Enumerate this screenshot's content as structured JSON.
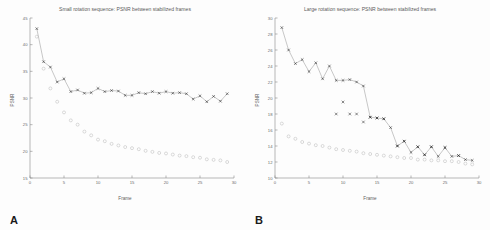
{
  "figure": {
    "background": "#fdfdfd",
    "panel_label_color": "#1a1a1a"
  },
  "panels": [
    {
      "id": "panel-a",
      "label": "A",
      "chart_key": "0"
    },
    {
      "id": "panel-b",
      "label": "B",
      "chart_key": "1"
    }
  ],
  "chart_data": [
    {
      "type": "line",
      "title": "Small rotation sequence: PSNR between stabilized frames",
      "xlabel": "Frame",
      "ylabel": "PSNR",
      "xlim": [
        0,
        30
      ],
      "ylim": [
        15,
        45
      ],
      "xticks": [
        0,
        5,
        10,
        15,
        20,
        25,
        30
      ],
      "yticks": [
        15,
        20,
        25,
        30,
        35,
        40,
        45
      ],
      "grid": false,
      "legend": "none",
      "x": [
        1,
        2,
        3,
        4,
        5,
        6,
        7,
        8,
        9,
        10,
        11,
        12,
        13,
        14,
        15,
        16,
        17,
        18,
        19,
        20,
        21,
        22,
        23,
        24,
        25,
        26,
        27,
        28,
        29
      ],
      "series": [
        {
          "name": "stabilized",
          "marker": "cross",
          "line": true,
          "color": "#2b2b2b",
          "line_color": "#9a9a9a",
          "values": [
            43.0,
            36.8,
            35.8,
            33.0,
            33.6,
            31.2,
            31.5,
            30.9,
            31.0,
            31.8,
            31.2,
            31.4,
            31.3,
            30.5,
            30.5,
            31.0,
            30.8,
            31.2,
            30.9,
            31.2,
            30.9,
            31.0,
            30.8,
            29.8,
            30.4,
            29.3,
            30.3,
            29.4,
            30.8
          ]
        },
        {
          "name": "unstabilized",
          "marker": "circle",
          "line": false,
          "color": "#b6b6b6",
          "values": [
            41.5,
            35.5,
            31.8,
            29.3,
            27.3,
            25.8,
            25.0,
            23.7,
            23.0,
            22.2,
            21.9,
            21.4,
            21.1,
            20.8,
            20.6,
            20.4,
            20.1,
            19.9,
            19.7,
            19.6,
            19.4,
            19.2,
            19.1,
            18.9,
            18.8,
            18.5,
            18.4,
            18.3,
            18.0
          ]
        }
      ]
    },
    {
      "type": "line",
      "title": "Large rotation sequence: PSNR between stabilized frames",
      "xlabel": "Frame",
      "ylabel": "PSNR",
      "xlim": [
        0,
        30
      ],
      "ylim": [
        10,
        30
      ],
      "xticks": [
        0,
        5,
        10,
        15,
        20,
        25,
        30
      ],
      "yticks": [
        10,
        12,
        14,
        16,
        18,
        20,
        22,
        24,
        26,
        28,
        30
      ],
      "grid": false,
      "legend": "none",
      "x": [
        1,
        2,
        3,
        4,
        5,
        6,
        7,
        8,
        9,
        10,
        11,
        12,
        13,
        14,
        15,
        16,
        17,
        18,
        19,
        20,
        21,
        22,
        23,
        24,
        25,
        26,
        27,
        28,
        29
      ],
      "series": [
        {
          "name": "stabilized",
          "marker": "cross",
          "line": true,
          "color": "#2b2b2b",
          "line_color": "#9a9a9a",
          "values": [
            28.8,
            26.0,
            24.3,
            24.8,
            23.3,
            24.4,
            22.4,
            24.0,
            22.2,
            22.2,
            22.3,
            22.0,
            21.5,
            17.6,
            17.5,
            17.4,
            16.3,
            14.0,
            14.6,
            13.2,
            13.9,
            12.9,
            13.9,
            12.7,
            13.8,
            12.7,
            12.8,
            12.3,
            12.2
          ]
        },
        {
          "name": "unstabilized",
          "marker": "circle",
          "line": false,
          "color": "#b6b6b6",
          "values": [
            16.8,
            15.2,
            14.9,
            14.5,
            14.3,
            14.1,
            14.0,
            13.8,
            13.6,
            13.5,
            13.4,
            13.3,
            13.1,
            13.0,
            12.9,
            12.8,
            12.7,
            12.6,
            12.5,
            12.5,
            12.3,
            12.3,
            12.2,
            12.2,
            12.1,
            12.1,
            12.0,
            11.8,
            11.7
          ]
        },
        {
          "name": "scattered-outliers",
          "marker": "cross-only",
          "line": false,
          "color": "#2b2b2b",
          "x": [
            9,
            10,
            11,
            12,
            13,
            14,
            15,
            16,
            18,
            19,
            21,
            22,
            23,
            25,
            27
          ],
          "values": [
            18.0,
            19.5,
            18.0,
            18.0,
            17.0,
            17.6,
            17.5,
            17.4,
            14.0,
            14.6,
            13.9,
            12.9,
            13.9,
            13.8,
            12.8
          ]
        }
      ]
    }
  ]
}
